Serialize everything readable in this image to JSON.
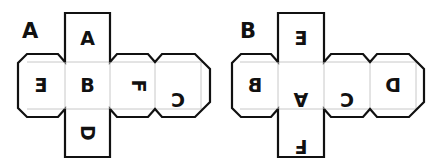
{
  "figures": [
    {
      "label": "A",
      "faces": {
        "top": "A",
        "left": "E",
        "center": "B",
        "right1": "F",
        "right2": "C",
        "bottom": "D"
      }
    },
    {
      "label": "B",
      "faces": {
        "top": "E",
        "left": "B",
        "center": "A",
        "right1": "C",
        "right2": "D",
        "bottom": "F"
      }
    }
  ],
  "colors": {
    "stroke": "#111111",
    "fold_line": "#c8c8c8",
    "background": "#ffffff"
  }
}
